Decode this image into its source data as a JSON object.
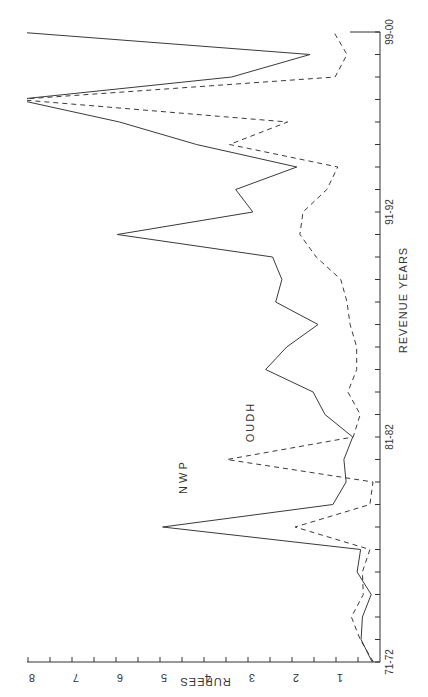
{
  "chart_data": {
    "type": "line",
    "orientation": "rotated-90-ccw",
    "title": "",
    "xlabel": "REVENUE YEARS",
    "ylabel": "RUPEES",
    "ylim": [
      0,
      8
    ],
    "y_ticks": [
      "1",
      "2",
      "3",
      "4",
      "5",
      "6",
      "7",
      "8"
    ],
    "x_tick_labels": [
      {
        "index": 0,
        "label": "71-72"
      },
      {
        "index": 10,
        "label": "81-82"
      },
      {
        "index": 20,
        "label": "91-92"
      },
      {
        "index": 28,
        "label": "99-00"
      }
    ],
    "categories": [
      "71-72",
      "72-73",
      "73-74",
      "74-75",
      "75-76",
      "76-77",
      "77-78",
      "78-79",
      "79-80",
      "80-81",
      "81-82",
      "82-83",
      "83-84",
      "84-85",
      "85-86",
      "86-87",
      "87-88",
      "88-89",
      "89-90",
      "90-91",
      "91-92",
      "92-93",
      "93-94",
      "94-95",
      "95-96",
      "96-97",
      "97-98",
      "98-99",
      "99-00"
    ],
    "series": [
      {
        "name": "N W P",
        "style": "solid",
        "values": [
          0.18,
          0.43,
          0.4,
          0.2,
          0.52,
          0.44,
          4.94,
          1.07,
          0.77,
          0.82,
          0.62,
          1.25,
          1.52,
          2.6,
          2.12,
          1.41,
          2.37,
          2.23,
          2.44,
          5.97,
          2.89,
          3.28,
          1.89,
          4.17,
          5.92,
          ">8",
          3.37,
          1.59,
          ">8"
        ]
      },
      {
        "name": "OUDH",
        "style": "dashed",
        "values": [
          0.15,
          0.45,
          0.65,
          0.38,
          0.4,
          0.23,
          1.93,
          0.23,
          0.16,
          3.48,
          0.61,
          0.45,
          0.73,
          0.53,
          0.53,
          0.68,
          0.75,
          0.89,
          1.45,
          1.82,
          1.75,
          1.21,
          0.96,
          3.42,
          2.1,
          ">8",
          1.02,
          0.75,
          1.05
        ]
      }
    ],
    "grid": false,
    "legend": "inline labels near lines",
    "annotations": [
      "N W P",
      "OUDH"
    ]
  },
  "labels": {
    "xlabel": "REVENUE YEARS",
    "ylabel": "RUPEES",
    "series_nwp": "N W P",
    "series_oudh": "OUDH"
  }
}
